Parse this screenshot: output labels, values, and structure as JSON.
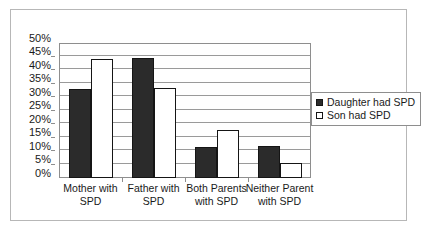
{
  "chart_data": {
    "type": "bar",
    "title": "",
    "subtitle": "",
    "xlabel": "",
    "ylabel": "",
    "categories": [
      "Mother with SPD",
      "Father with SPD",
      "Both Parents with SPD",
      "Neither Parent with SPD"
    ],
    "series": [
      {
        "name": "Daughter had SPD",
        "color": "#2b2b2b",
        "values": [
          33.0,
          44.5,
          11.4,
          11.8
        ]
      },
      {
        "name": "Son had SPD",
        "color": "#ffffff",
        "values": [
          44.2,
          33.4,
          17.7,
          5.7
        ]
      }
    ],
    "ylim": [
      0,
      50
    ],
    "ytick_values": [
      0,
      5,
      10,
      15,
      20,
      25,
      30,
      35,
      40,
      45,
      50
    ],
    "ytick_labels": [
      "0%",
      "5%",
      "10%",
      "15%",
      "20%",
      "25%",
      "30%",
      "35%",
      "40%",
      "45%",
      "50%"
    ],
    "value_suffix": "%",
    "grid": "horizontal",
    "legend_position": "right",
    "plot_background": "#ffffff",
    "grid_color": "#9a9a9a",
    "axis_color": "#8e8e8e",
    "frame_color": "#b7b7b7"
  },
  "legend": {
    "entries": [
      {
        "label": "Daughter had SPD",
        "marker": "filled-square-icon"
      },
      {
        "label": "Son had SPD",
        "marker": "hollow-square-icon"
      }
    ]
  }
}
